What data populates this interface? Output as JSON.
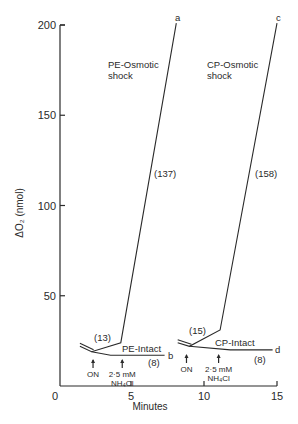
{
  "chart_data": {
    "type": "line",
    "title": "",
    "xlabel": "Minutes",
    "ylabel": "ΔO₂ (nmol)",
    "xlim": [
      0,
      15
    ],
    "ylim": [
      0,
      200
    ],
    "xticks": [
      0,
      5,
      10,
      15
    ],
    "xtick_labels": [
      "0",
      "5",
      "10",
      "15"
    ],
    "yticks": [
      50,
      100,
      150,
      200
    ],
    "ytick_labels": [
      "50",
      "100",
      "150",
      "200"
    ],
    "grid": false,
    "legend": "none",
    "series": [
      {
        "name": "PE-Osmotic shock",
        "end_label": "a",
        "rate_label": "(137)",
        "pre_rate_label": "(13)",
        "points": [
          [
            1.5,
            22
          ],
          [
            2.3,
            19
          ],
          [
            4.3,
            24
          ],
          [
            8.1,
            201
          ]
        ]
      },
      {
        "name": "PE-Intact",
        "end_label": "b",
        "rate_label": "(8)",
        "points": [
          [
            2.3,
            19
          ],
          [
            3.6,
            17
          ],
          [
            7.3,
            17
          ]
        ]
      },
      {
        "name": "CP-Osmotic shock",
        "end_label": "c",
        "rate_label": "(158)",
        "pre_rate_label": "(15)",
        "points": [
          [
            8.2,
            24
          ],
          [
            9.0,
            22
          ],
          [
            11.1,
            31
          ],
          [
            15.0,
            201
          ]
        ]
      },
      {
        "name": "CP-Intact",
        "end_label": "d",
        "rate_label": "(8)",
        "points": [
          [
            9.0,
            22
          ],
          [
            11.8,
            20
          ],
          [
            14.7,
            20
          ]
        ]
      }
    ],
    "annotations": [
      {
        "text": "ON",
        "x": 2.4,
        "arrow": true
      },
      {
        "text": "2·5 mM",
        "text2": "NH₄Cl",
        "x": 4.4,
        "arrow": true
      },
      {
        "text": "ON",
        "x": 8.8,
        "arrow": true
      },
      {
        "text": "2·5 mM",
        "text2": "NH₄Cl",
        "x": 11.0,
        "arrow": true
      }
    ],
    "curve_titles": {
      "pe_shock_line1": "PE-Osmotic",
      "pe_shock_line2": "shock",
      "cp_shock_line1": "CP-Osmotic",
      "cp_shock_line2": "shock",
      "pe_intact": "PE-Intact",
      "cp_intact": "CP-Intact"
    }
  }
}
